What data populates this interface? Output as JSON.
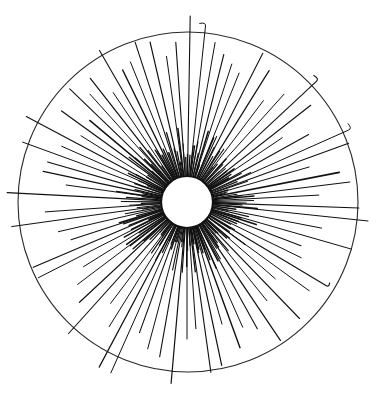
{
  "figure": {
    "width": 376,
    "height": 399,
    "background": "#ffffff",
    "ink_color": "#111111",
    "outer_circle": {
      "cx": 188,
      "cy": 202,
      "r": 170,
      "stroke": "#2a2a2a"
    },
    "inner_circle": {
      "cx": 187,
      "cy": 202,
      "r": 26
    },
    "rays_origin_radius": 27,
    "rays": [
      {
        "angle": -89,
        "length": 159,
        "width": 1.1,
        "curl": 0
      },
      {
        "angle": -84,
        "length": 150,
        "width": 1.0,
        "curl": 6
      },
      {
        "angle": -94,
        "length": 133,
        "width": 1.1,
        "curl": 0
      },
      {
        "angle": -98,
        "length": 120,
        "width": 1.0,
        "curl": 0
      },
      {
        "angle": -103,
        "length": 137,
        "width": 1.2,
        "curl": 0
      },
      {
        "angle": -108,
        "length": 141,
        "width": 1.1,
        "curl": 0
      },
      {
        "angle": -112,
        "length": 124,
        "width": 1.0,
        "curl": 0
      },
      {
        "angle": -116,
        "length": 120,
        "width": 1.3,
        "curl": 0
      },
      {
        "angle": -120,
        "length": 148,
        "width": 1.1,
        "curl": 0
      },
      {
        "angle": -124,
        "length": 105,
        "width": 1.0,
        "curl": 0
      },
      {
        "angle": -128,
        "length": 130,
        "width": 1.2,
        "curl": 0
      },
      {
        "angle": -132,
        "length": 118,
        "width": 1.0,
        "curl": 0
      },
      {
        "angle": -136,
        "length": 136,
        "width": 1.1,
        "curl": 0
      },
      {
        "angle": -140,
        "length": 100,
        "width": 1.4,
        "curl": 0
      },
      {
        "angle": -144,
        "length": 128,
        "width": 1.2,
        "curl": 0
      },
      {
        "angle": -148,
        "length": 98,
        "width": 1.0,
        "curl": 0
      },
      {
        "angle": -152,
        "length": 155,
        "width": 1.1,
        "curl": 0
      },
      {
        "angle": -156,
        "length": 110,
        "width": 1.0,
        "curl": 0
      },
      {
        "angle": -160,
        "length": 148,
        "width": 1.0,
        "curl": 0
      },
      {
        "angle": -164,
        "length": 118,
        "width": 1.2,
        "curl": 0
      },
      {
        "angle": -168,
        "length": 120,
        "width": 1.3,
        "curl": 0
      },
      {
        "angle": -172,
        "length": 95,
        "width": 1.0,
        "curl": 0
      },
      {
        "angle": -177,
        "length": 153,
        "width": 1.2,
        "curl": 0
      },
      {
        "angle": 176,
        "length": 115,
        "width": 1.0,
        "curl": 0
      },
      {
        "angle": 172,
        "length": 150,
        "width": 1.0,
        "curl": 0
      },
      {
        "angle": 167,
        "length": 105,
        "width": 1.0,
        "curl": 0
      },
      {
        "angle": 162,
        "length": 95,
        "width": 1.1,
        "curl": 0
      },
      {
        "angle": 157,
        "length": 140,
        "width": 1.2,
        "curl": 0
      },
      {
        "angle": 153,
        "length": 140,
        "width": 1.0,
        "curl": 0
      },
      {
        "angle": 148,
        "length": 95,
        "width": 1.0,
        "curl": 0
      },
      {
        "angle": 143,
        "length": 110,
        "width": 1.0,
        "curl": 0
      },
      {
        "angle": 137,
        "length": 120,
        "width": 1.2,
        "curl": 0
      },
      {
        "angle": 132,
        "length": 150,
        "width": 1.1,
        "curl": 0
      },
      {
        "angle": 127,
        "length": 100,
        "width": 1.0,
        "curl": 0
      },
      {
        "angle": 122,
        "length": 120,
        "width": 1.0,
        "curl": 0
      },
      {
        "angle": 118,
        "length": 160,
        "width": 1.2,
        "curl": 0
      },
      {
        "angle": 114,
        "length": 160,
        "width": 1.0,
        "curl": 0
      },
      {
        "angle": 110,
        "length": 112,
        "width": 1.1,
        "curl": 0
      },
      {
        "angle": 105,
        "length": 125,
        "width": 1.0,
        "curl": 0
      },
      {
        "angle": 100,
        "length": 130,
        "width": 1.1,
        "curl": 0
      },
      {
        "angle": 95,
        "length": 155,
        "width": 1.2,
        "curl": 0
      },
      {
        "angle": 90,
        "length": 110,
        "width": 1.0,
        "curl": 0
      },
      {
        "angle": 86,
        "length": 100,
        "width": 1.0,
        "curl": 0
      },
      {
        "angle": 82,
        "length": 145,
        "width": 1.1,
        "curl": 0
      },
      {
        "angle": 78,
        "length": 140,
        "width": 1.2,
        "curl": 0
      },
      {
        "angle": 74,
        "length": 100,
        "width": 1.0,
        "curl": 0
      },
      {
        "angle": 70,
        "length": 128,
        "width": 1.4,
        "curl": 0
      },
      {
        "angle": 66,
        "length": 110,
        "width": 1.0,
        "curl": 0
      },
      {
        "angle": 61,
        "length": 118,
        "width": 1.1,
        "curl": 0
      },
      {
        "angle": 56,
        "length": 140,
        "width": 1.2,
        "curl": 0
      },
      {
        "angle": 51,
        "length": 100,
        "width": 1.0,
        "curl": 0
      },
      {
        "angle": 46,
        "length": 135,
        "width": 1.1,
        "curl": 0
      },
      {
        "angle": 41,
        "length": 90,
        "width": 1.0,
        "curl": 0
      },
      {
        "angle": 36,
        "length": 124,
        "width": 1.0,
        "curl": 0
      },
      {
        "angle": 31,
        "length": 135,
        "width": 1.2,
        "curl": 4
      },
      {
        "angle": 26,
        "length": 100,
        "width": 1.0,
        "curl": 0
      },
      {
        "angle": 21,
        "length": 95,
        "width": 1.1,
        "curl": 0
      },
      {
        "angle": 16,
        "length": 144,
        "width": 1.0,
        "curl": 0
      },
      {
        "angle": 11,
        "length": 110,
        "width": 1.0,
        "curl": 0
      },
      {
        "angle": 6,
        "length": 155,
        "width": 1.0,
        "curl": 0
      },
      {
        "angle": 2,
        "length": 145,
        "width": 1.1,
        "curl": 0
      },
      {
        "angle": -3,
        "length": 105,
        "width": 1.0,
        "curl": 0
      },
      {
        "angle": -7,
        "length": 137,
        "width": 1.1,
        "curl": 0
      },
      {
        "angle": -11,
        "length": 128,
        "width": 1.6,
        "curl": 0
      },
      {
        "angle": -16,
        "length": 100,
        "width": 1.0,
        "curl": 0
      },
      {
        "angle": -20,
        "length": 145,
        "width": 1.1,
        "curl": 0
      },
      {
        "angle": -24,
        "length": 150,
        "width": 1.0,
        "curl": 6
      },
      {
        "angle": -29,
        "length": 112,
        "width": 1.1,
        "curl": 0
      },
      {
        "angle": -34,
        "length": 88,
        "width": 1.0,
        "curl": 0
      },
      {
        "angle": -38,
        "length": 130,
        "width": 1.2,
        "curl": 0
      },
      {
        "angle": -43,
        "length": 150,
        "width": 1.1,
        "curl": 6
      },
      {
        "angle": -48,
        "length": 118,
        "width": 1.0,
        "curl": 0
      },
      {
        "angle": -53,
        "length": 100,
        "width": 1.0,
        "curl": 0
      },
      {
        "angle": -58,
        "length": 128,
        "width": 1.2,
        "curl": 0
      },
      {
        "angle": -63,
        "length": 140,
        "width": 1.1,
        "curl": 0
      },
      {
        "angle": -68,
        "length": 112,
        "width": 1.0,
        "curl": 0
      },
      {
        "angle": -72,
        "length": 118,
        "width": 1.0,
        "curl": 0
      },
      {
        "angle": -76,
        "length": 125,
        "width": 1.1,
        "curl": 0
      },
      {
        "angle": -80,
        "length": 135,
        "width": 1.0,
        "curl": 0
      }
    ],
    "short_rays": {
      "count": 140,
      "min_length": 12,
      "max_length": 48,
      "width": 1.0
    }
  }
}
